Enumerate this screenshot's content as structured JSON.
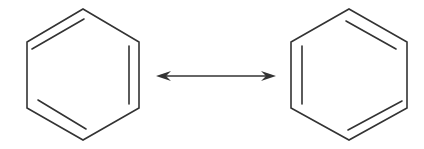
{
  "diagram": {
    "structures": [
      {
        "name": "benzene-kekule-1",
        "double_bonds": [
          "top-left",
          "right",
          "bottom-left"
        ]
      },
      {
        "name": "benzene-kekule-2",
        "double_bonds": [
          "top-right",
          "left",
          "bottom-right"
        ]
      }
    ],
    "connector": {
      "type": "resonance-double-headed-arrow"
    },
    "colors": {
      "line": "#333333",
      "background": "#ffffff"
    }
  }
}
